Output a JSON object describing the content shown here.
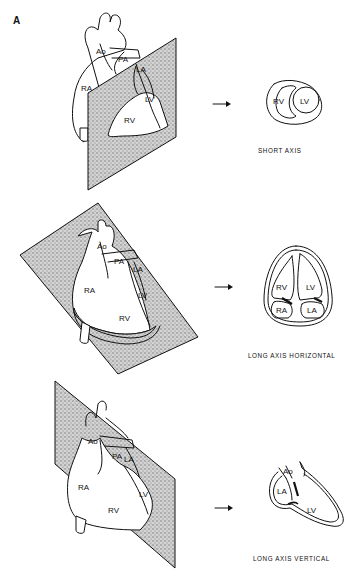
{
  "figure": {
    "panel_letter": "A",
    "rows": [
      {
        "plane": "short-axis",
        "heart_labels": {
          "ao": "Ao",
          "pa": "PA",
          "ra": "RA",
          "la": "LA",
          "lv": "LV",
          "rv": "RV"
        },
        "section_labels": {
          "rv": "RV",
          "lv": "LV"
        },
        "caption": "SHORT AXIS"
      },
      {
        "plane": "long-axis-horizontal",
        "heart_labels": {
          "ao": "Ao",
          "pa": "PA",
          "ra": "RA",
          "la": "LA",
          "lv": "LV",
          "rv": "RV"
        },
        "section_labels": {
          "rv": "RV",
          "lv": "LV",
          "ra": "RA",
          "la": "LA"
        },
        "caption": "LONG AXIS HORIZONTAL"
      },
      {
        "plane": "long-axis-vertical",
        "heart_labels": {
          "ao": "Ao",
          "pa": "PA",
          "ra": "RA",
          "la": "LA",
          "lv": "LV",
          "rv": "RV"
        },
        "section_labels": {
          "ao": "Ao",
          "la": "LA",
          "lv": "LV"
        },
        "caption": "LONG AXIS VERTICAL"
      }
    ],
    "arrow_glyph": "→",
    "colors": {
      "ink": "#111111",
      "background": "#ffffff",
      "stipple": "#9a9a9a"
    }
  }
}
